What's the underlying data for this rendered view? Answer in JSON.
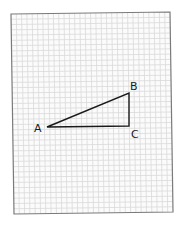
{
  "diagram": {
    "type": "right-triangle-on-graph-paper",
    "paper": {
      "corners": {
        "top_left": [
          11,
          14
        ],
        "top_right": [
          170,
          12
        ],
        "bottom_right": [
          173,
          212
        ],
        "bottom_left": [
          14,
          214
        ]
      },
      "border_color": "#7a7a7a",
      "grid_color": "#d9d9d9",
      "grid_columns": 30,
      "grid_rows": 38
    },
    "triangle": {
      "stroke_color": "#1a1a1a",
      "vertices": [
        {
          "name": "A",
          "x": 47,
          "y": 127,
          "label_x": 34,
          "label_y": 132
        },
        {
          "name": "B",
          "x": 129,
          "y": 93,
          "label_x": 130,
          "label_y": 90
        },
        {
          "name": "C",
          "x": 129,
          "y": 126,
          "label_x": 131,
          "label_y": 138
        }
      ],
      "right_angle_at": "C"
    }
  }
}
